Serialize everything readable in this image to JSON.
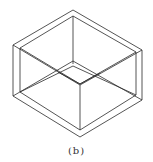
{
  "figure": {
    "caption": "(b)",
    "stroke_color": "#2a2a2a",
    "background": "#ffffff"
  }
}
